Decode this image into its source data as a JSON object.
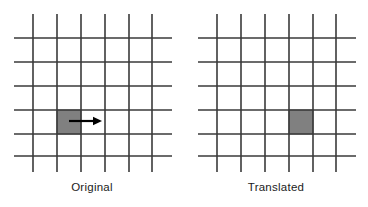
{
  "figure": {
    "type": "diagram",
    "width": 368,
    "height": 207,
    "background_color": "#ffffff"
  },
  "style": {
    "grid_line_color": "#3a3a3a",
    "grid_line_width": 1.6,
    "cell_fill_color": "#808080",
    "cell_stroke_color": "#5a5a5a",
    "arrow_color": "#000000",
    "caption_color": "#1b1b1b"
  },
  "grid": {
    "vertical_line_count": 6,
    "horizontal_line_count": 6,
    "cell_size": 24,
    "vertical_x": [
      33,
      57,
      81,
      105,
      129,
      152
    ],
    "horizontal_y": [
      38,
      62,
      86,
      110,
      134,
      156
    ],
    "vertical_span_y": [
      14,
      172
    ],
    "horizontal_span_x": [
      14,
      172
    ]
  },
  "panels": [
    {
      "id": "original",
      "caption": "Original",
      "offset_x": 0,
      "square": {
        "label": "highlighted-cell",
        "x": 57,
        "y": 110,
        "width": 24,
        "height": 24,
        "column_index": 1,
        "row_index": 3
      },
      "arrow": {
        "label": "translation-arrow",
        "direction": "right",
        "x_start": 69,
        "x_end": 101,
        "y": 121,
        "head_width": 9,
        "head_height": 8,
        "shaft_width": 2.2
      }
    },
    {
      "id": "translated",
      "caption": "Translated",
      "offset_x": 184,
      "square": {
        "label": "highlighted-cell",
        "x": 105,
        "y": 110,
        "width": 24,
        "height": 24,
        "column_index": 3,
        "row_index": 3
      },
      "arrow": null
    }
  ],
  "captions": {
    "left": "Original",
    "right": "Translated"
  }
}
